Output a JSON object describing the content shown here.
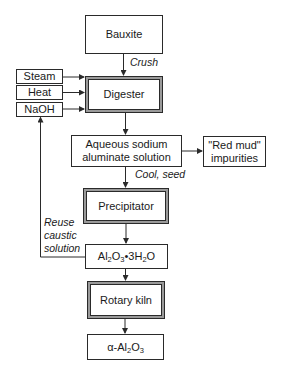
{
  "diagram": {
    "nodes": {
      "bauxite": "Bauxite",
      "steam": "Steam",
      "heat": "Heat",
      "naoh": "NaOH",
      "digester": "Digester",
      "aqueous_line1": "Aqueous sodium",
      "aqueous_line2": "aluminate solution",
      "redmud_line1": "\"Red mud\"",
      "redmud_line2": "impurities",
      "precipitator": "Precipitator",
      "hydrate": {
        "p1": "Al",
        "s1": "2",
        "p2": "O",
        "s2": "3",
        "p3": "•3H",
        "s3": "2",
        "p4": "O"
      },
      "rotary_kiln": "Rotary kiln",
      "alpha_alumina": {
        "p1": "α-Al",
        "s1": "2",
        "p2": "O",
        "s2": "3"
      }
    },
    "edge_labels": {
      "crush": "Crush",
      "cool_seed": "Cool, seed",
      "reuse_line1": "Reuse",
      "reuse_line2": "caustic",
      "reuse_line3": "solution"
    },
    "colors": {
      "line": "#2a2a2a",
      "double_border_mid": "#9a9a9a",
      "background": "#ffffff"
    }
  }
}
